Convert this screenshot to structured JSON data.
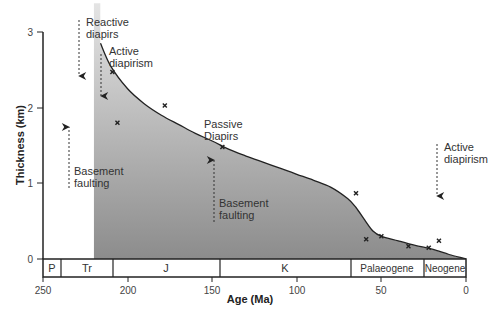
{
  "chart_data": {
    "type": "area",
    "title": "",
    "xlabel": "Age (Ma)",
    "ylabel": "Thickness (km)",
    "xlim": [
      250,
      0
    ],
    "ylim": [
      0,
      3
    ],
    "x_ticks": [
      "250",
      "200",
      "150",
      "100",
      "50",
      "0"
    ],
    "y_ticks": [
      "0",
      "1",
      "2",
      "3"
    ],
    "grid": false,
    "legend": null,
    "curve": {
      "name": "Sediment thickness",
      "x": [
        216,
        210,
        200,
        190,
        180,
        170,
        160,
        150,
        140,
        130,
        120,
        110,
        100,
        90,
        80,
        70,
        65,
        60,
        55,
        50,
        40,
        30,
        20,
        10,
        0
      ],
      "y": [
        2.85,
        2.55,
        2.25,
        2.05,
        1.9,
        1.78,
        1.66,
        1.56,
        1.45,
        1.36,
        1.28,
        1.2,
        1.12,
        1.04,
        0.95,
        0.8,
        0.68,
        0.52,
        0.37,
        0.3,
        0.24,
        0.18,
        0.13,
        0.06,
        0.0
      ]
    },
    "shaded_region_start_age": 220,
    "points": {
      "name": "Observed data",
      "x": [
        209,
        206,
        178,
        144,
        65,
        59,
        50,
        34,
        22,
        16
      ],
      "y": [
        2.47,
        1.8,
        2.03,
        1.48,
        0.87,
        0.26,
        0.3,
        0.17,
        0.15,
        0.24
      ]
    },
    "periods": [
      {
        "label": "P",
        "start": 250,
        "end": 242
      },
      {
        "label": "Tr",
        "start": 242,
        "end": 210
      },
      {
        "label": "J",
        "start": 210,
        "end": 146
      },
      {
        "label": "K",
        "start": 146,
        "end": 66
      },
      {
        "label": "Palaeogene",
        "start": 66,
        "end": 23
      },
      {
        "label": "Neogene",
        "start": 23,
        "end": 0
      }
    ],
    "annotations": [
      {
        "text": [
          "Reactive",
          "diapirs"
        ],
        "arrow": "down",
        "age": 229
      },
      {
        "text": [
          "Active",
          "diapirism"
        ],
        "arrow": "down",
        "age": 217
      },
      {
        "text": [
          "Basement",
          "faulting"
        ],
        "arrow": "up",
        "age": 234
      },
      {
        "text": [
          "Passive",
          "Diapirs"
        ],
        "arrow": "none",
        "age": 152
      },
      {
        "text": [
          "Basement",
          "faulting"
        ],
        "arrow": "up",
        "age": 149
      },
      {
        "text": [
          "Active",
          "diapirism"
        ],
        "arrow": "down",
        "age": 18
      }
    ]
  },
  "labels": {
    "xlabel": "Age (Ma)",
    "ylabel": "Thickness (km)",
    "xticks": [
      "250",
      "200",
      "150",
      "100",
      "50",
      "0"
    ],
    "yticks": [
      "0",
      "1",
      "2",
      "3"
    ],
    "periods": [
      "P",
      "Tr",
      "J",
      "K",
      "Palaeogene",
      "Neogene"
    ],
    "ann_reactive_1": "Reactive",
    "ann_reactive_2": "diapirs",
    "ann_active1_1": "Active",
    "ann_active1_2": "diapirism",
    "ann_basement1_1": "Basement",
    "ann_basement1_2": "faulting",
    "ann_passive_1": "Passive",
    "ann_passive_2": "Diapirs",
    "ann_basement2_1": "Basement",
    "ann_basement2_2": "faulting",
    "ann_active2_1": "Active",
    "ann_active2_2": "diapirism"
  },
  "colors": {
    "fill_top": "#dcdcdc",
    "fill_bottom": "#8e8e8e",
    "line": "#222222",
    "text": "#333333"
  }
}
